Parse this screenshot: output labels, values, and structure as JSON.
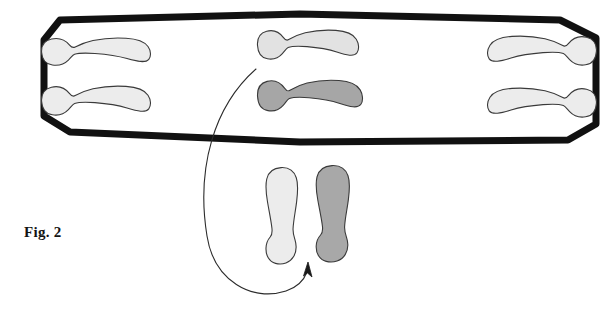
{
  "figure": {
    "caption": "Fig. 2",
    "background_color": "#ffffff",
    "width": 616,
    "height": 313
  },
  "colors": {
    "outline_black": "#111111",
    "footprint_stroke": "#3a3a3a",
    "footprint_light_fill": "#ececec",
    "footprint_mid_fill": "#d8d8d8",
    "footprint_dark_fill": "#9e9e9e",
    "arrow_stroke": "#2b2b2b",
    "caption_color": "#141414"
  },
  "boundary": {
    "name": "mat-outline",
    "shape": "elongated-hexagon",
    "stroke_width_px": 7,
    "points": "44,40 60,20 300,14 560,20 596,38 596,124 568,140 300,142 70,132 44,116"
  },
  "footprints": [
    {
      "id": "left-upper",
      "group": "left-pair",
      "orientation": "horizontal",
      "facing": "right",
      "shade": "light",
      "fill": "#ececec",
      "x": 40,
      "y": 36,
      "w": 112,
      "h": 32
    },
    {
      "id": "left-lower",
      "group": "left-pair",
      "orientation": "horizontal",
      "facing": "right",
      "shade": "light",
      "fill": "#ececec",
      "x": 40,
      "y": 84,
      "w": 112,
      "h": 34
    },
    {
      "id": "center-upper",
      "group": "center-pair",
      "orientation": "horizontal",
      "facing": "right",
      "shade": "light",
      "fill": "#e2e2e2",
      "x": 256,
      "y": 28,
      "w": 104,
      "h": 34
    },
    {
      "id": "center-lower",
      "group": "center-pair",
      "orientation": "horizontal",
      "facing": "right",
      "shade": "dark",
      "fill": "#a6a6a6",
      "x": 256,
      "y": 78,
      "w": 108,
      "h": 36
    },
    {
      "id": "right-upper",
      "group": "right-pair",
      "orientation": "horizontal",
      "facing": "left",
      "shade": "light",
      "fill": "#ececec",
      "x": 486,
      "y": 34,
      "w": 112,
      "h": 34
    },
    {
      "id": "right-lower",
      "group": "right-pair",
      "orientation": "horizontal",
      "facing": "left",
      "shade": "light",
      "fill": "#ececec",
      "x": 486,
      "y": 86,
      "w": 112,
      "h": 34
    },
    {
      "id": "bottom-left",
      "group": "bottom-pair",
      "orientation": "vertical",
      "facing": "up",
      "shade": "light",
      "fill": "#ececec",
      "x": 262,
      "y": 166,
      "w": 40,
      "h": 100
    },
    {
      "id": "bottom-right",
      "group": "bottom-pair",
      "orientation": "vertical",
      "facing": "up",
      "shade": "dark",
      "fill": "#a8a8a8",
      "x": 312,
      "y": 164,
      "w": 42,
      "h": 100
    }
  ],
  "annotation_arrow": {
    "name": "curved-arrow",
    "stroke_width_px": 1.1,
    "path": "M 256,69 C 214,106 196,168 207,236 C 214,281 252,302 286,291 C 298,287 304,280 307,272",
    "head": "308,262 303.5,276 307.5,273 312,277",
    "direction": "points-up-at-bottom-footprints"
  }
}
